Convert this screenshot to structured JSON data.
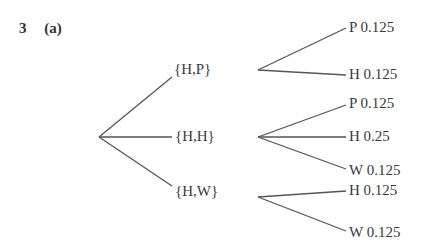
{
  "heading": {
    "number": "3",
    "part": "(a)"
  },
  "tree": {
    "root": {
      "x": 99,
      "y": 137
    },
    "branches": [
      {
        "label": "{H,P}",
        "label_pos": {
          "x": 174,
          "y": 61
        },
        "in": {
          "x": 172,
          "y": 77
        },
        "out": {
          "x": 258,
          "y": 70
        },
        "leaves": [
          {
            "label": "P 0.125",
            "outcome": "P",
            "probability": 0.125,
            "end": {
              "x": 346,
              "y": 28
            },
            "label_pos": {
              "x": 349,
              "y": 19
            }
          },
          {
            "label": "H 0.125",
            "outcome": "H",
            "probability": 0.125,
            "end": {
              "x": 346,
              "y": 75
            },
            "label_pos": {
              "x": 349,
              "y": 66
            }
          }
        ]
      },
      {
        "label": "{H,H}",
        "label_pos": {
          "x": 175,
          "y": 128
        },
        "in": {
          "x": 172,
          "y": 137
        },
        "out": {
          "x": 258,
          "y": 137
        },
        "leaves": [
          {
            "label": "P 0.125",
            "outcome": "P",
            "probability": 0.125,
            "end": {
              "x": 346,
              "y": 105
            },
            "label_pos": {
              "x": 349,
              "y": 95
            }
          },
          {
            "label": "H 0.25",
            "outcome": "H",
            "probability": 0.25,
            "end": {
              "x": 346,
              "y": 137
            },
            "label_pos": {
              "x": 349,
              "y": 128
            }
          },
          {
            "label": "W 0.125",
            "outcome": "W",
            "probability": 0.125,
            "end": {
              "x": 346,
              "y": 169
            },
            "label_pos": {
              "x": 349,
              "y": 162
            }
          }
        ]
      },
      {
        "label": "{H,W}",
        "label_pos": {
          "x": 175,
          "y": 183
        },
        "in": {
          "x": 172,
          "y": 186
        },
        "out": {
          "x": 258,
          "y": 197
        },
        "leaves": [
          {
            "label": "H 0.125",
            "outcome": "H",
            "probability": 0.125,
            "end": {
              "x": 346,
              "y": 191
            },
            "label_pos": {
              "x": 349,
              "y": 182
            }
          },
          {
            "label": "W 0.125",
            "outcome": "W",
            "probability": 0.125,
            "end": {
              "x": 346,
              "y": 231
            },
            "label_pos": {
              "x": 349,
              "y": 224
            }
          }
        ]
      }
    ]
  }
}
